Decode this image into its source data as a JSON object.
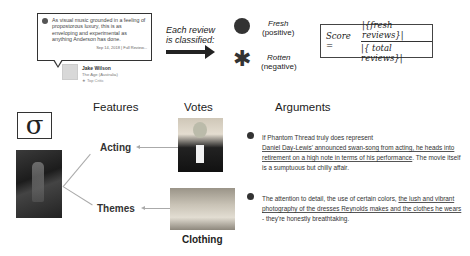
{
  "review_card": {
    "quote": "As visual music grounded in a feeling of propostorous luxury, this is as enveloping and experimental as anything Anderson has done.",
    "date_link": "Sep 14, 2018 | Full Review...",
    "critic_name": "Jake Wilson",
    "publication": "The Age (Australia)",
    "badge": "Top Critic"
  },
  "classification": {
    "label_line1": "Each review",
    "label_line2": "is classified:",
    "fresh_title": "Fresh",
    "fresh_sub": "(positive)",
    "rotten_title": "Rotten",
    "rotten_sub": "(negative)"
  },
  "score": {
    "lhs": "Score =",
    "numerator": "|{fresh reviews}|",
    "denominator": "|{ total reviews}|"
  },
  "lower": {
    "sigma_symbol": "σ",
    "headers": {
      "features": "Features",
      "votes": "Votes",
      "arguments": "Arguments"
    },
    "features": [
      {
        "label": "Acting"
      },
      {
        "label": "Themes"
      }
    ],
    "vote_labels": {
      "clothing": "Clothing"
    },
    "arguments": [
      {
        "pre": "If Phantom Thread truly does represent",
        "underlined": "Daniel Day-Lewis' announced swan-song from acting, he heads into retirement on a high note in terms of his performance",
        "post": ". The movie itself is a sumptuous but chilly affair."
      },
      {
        "pre": "The attention to detail, the use of certain colors, ",
        "underlined": "the lush and vibrant photography of the dresses Reynolds makes and the clothes he wears",
        "post": " - they're honestly breathtaking."
      }
    ]
  }
}
